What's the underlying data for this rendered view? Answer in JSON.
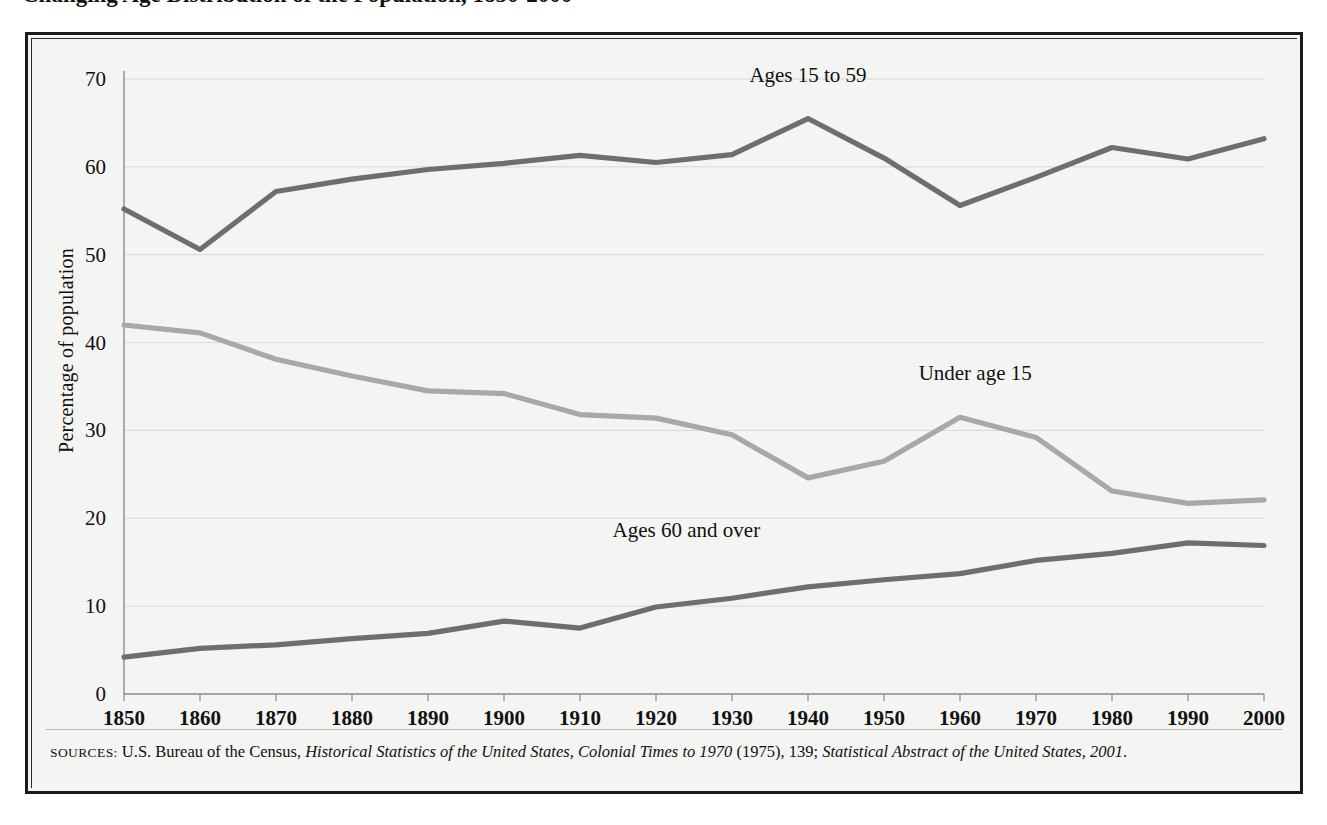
{
  "figure": {
    "title": "Changing Age Distribution of the Population, 1850-2000",
    "y_axis_label": "Percentage of population",
    "source_prefix": "SOURCES:",
    "source_text_1": "U.S. Bureau of the Census, ",
    "source_italic_1": "Historical Statistics of the United States, Colonial Times to 1970",
    "source_text_2": " (1975), 139; ",
    "source_italic_2": "Statistical Abstract of the United States, 2001",
    "source_text_3": "."
  },
  "colors": {
    "page_background": "#ffffff",
    "panel_background": "#f4f4f2",
    "frame": "#1b1b1b",
    "gridline": "#d8d8d4",
    "axis": "#8a8a86",
    "series_ages_15_to_59": "#6e6e6e",
    "series_under_age_15": "#a8a8a8",
    "series_ages_60_and_over": "#6e6e6e",
    "text": "#111111"
  },
  "chart_data": {
    "type": "line",
    "title": "Changing Age Distribution of the Population, 1850-2000",
    "xlabel": "",
    "ylabel": "Percentage of population",
    "xlim": [
      1850,
      2000
    ],
    "ylim": [
      0,
      70
    ],
    "yticks": [
      0,
      10,
      20,
      30,
      40,
      50,
      60,
      70
    ],
    "grid": true,
    "legend": "inline-annotations",
    "x": [
      1850,
      1860,
      1870,
      1880,
      1890,
      1900,
      1910,
      1920,
      1930,
      1940,
      1950,
      1960,
      1970,
      1980,
      1990,
      2000
    ],
    "categories": [
      "1850",
      "1860",
      "1870",
      "1880",
      "1890",
      "1900",
      "1910",
      "1920",
      "1930",
      "1940",
      "1950",
      "1960",
      "1970",
      "1980",
      "1990",
      "2000"
    ],
    "series": [
      {
        "name": "Ages 15 to 59",
        "color": "#6e6e6e",
        "label_x": 1940,
        "label_y": 70.5,
        "values": [
          55.2,
          50.6,
          57.2,
          58.6,
          59.7,
          60.4,
          61.3,
          60.5,
          61.4,
          65.5,
          61.0,
          55.6,
          58.8,
          62.2,
          60.9,
          63.2
        ]
      },
      {
        "name": "Under age 15",
        "color": "#a8a8a8",
        "label_x": 1962,
        "label_y": 36.5,
        "values": [
          42.0,
          41.1,
          38.1,
          36.2,
          34.5,
          34.2,
          31.8,
          31.4,
          29.5,
          24.6,
          26.5,
          31.5,
          29.2,
          23.1,
          21.7,
          22.1
        ]
      },
      {
        "name": "Ages 60 and over",
        "color": "#6e6e6e",
        "label_x": 1924,
        "label_y": 18.7,
        "values": [
          4.2,
          5.2,
          5.6,
          6.3,
          6.9,
          8.3,
          7.5,
          9.9,
          10.9,
          12.2,
          13.0,
          13.7,
          15.2,
          16.0,
          17.2,
          16.9
        ]
      }
    ]
  }
}
